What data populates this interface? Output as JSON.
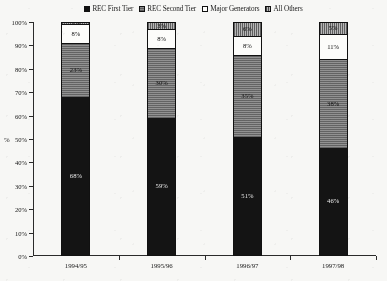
{
  "chart_data": {
    "type": "bar",
    "subtype": "100% stacked column",
    "title": "",
    "xlabel": "",
    "ylabel": "%",
    "ylim": [
      0,
      100
    ],
    "ytick_labels": [
      "0%",
      "10%",
      "20%",
      "30%",
      "40%",
      "50%",
      "60%",
      "70%",
      "80%",
      "90%",
      "100%"
    ],
    "ytick_values": [
      0,
      10,
      20,
      30,
      40,
      50,
      60,
      70,
      80,
      90,
      100
    ],
    "grid": false,
    "legend_position": "top-center",
    "categories": [
      "1994/95",
      "1995/96",
      "1996/97",
      "1997/98"
    ],
    "series": [
      {
        "name": "REC First Tier",
        "swatch": "solid-black",
        "color": "#141414",
        "values": [
          68,
          59,
          51,
          46
        ],
        "labels": [
          "68%",
          "59%",
          "51%",
          "46%"
        ]
      },
      {
        "name": "REC Second Tier",
        "swatch": "gray-hatch-horizontal",
        "color": "#878787",
        "values": [
          23,
          30,
          35,
          38
        ],
        "labels": [
          "23%",
          "30%",
          "35%",
          "38%"
        ]
      },
      {
        "name": "Major Generators",
        "swatch": "white",
        "color": "#fcfcfa",
        "values": [
          8,
          8,
          8,
          11
        ],
        "labels": [
          "8%",
          "8%",
          "8%",
          "11%"
        ]
      },
      {
        "name": "All Others",
        "swatch": "gray-hatch-vertical",
        "color": "#b0b0b0",
        "values": [
          1,
          3,
          6,
          5
        ],
        "labels": [
          "1%",
          "3%",
          "6%",
          "5%"
        ]
      }
    ]
  },
  "legend": {
    "items": [
      {
        "label": "REC First Tier"
      },
      {
        "label": "REC Second Tier"
      },
      {
        "label": "Major Generators"
      },
      {
        "label": "All Others"
      }
    ]
  },
  "axes": {
    "y_title": "%"
  }
}
